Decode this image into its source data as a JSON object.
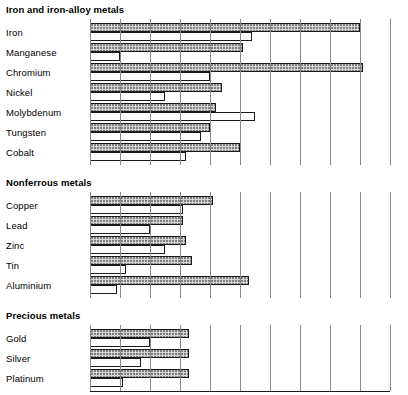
{
  "chart_data": {
    "type": "bar",
    "orientation": "horizontal",
    "title": "",
    "xlabel": "",
    "ylabel": "",
    "xlim": [
      1960,
      2600
    ],
    "xticks": [
      1960,
      1970,
      1980,
      1990,
      2000,
      2100,
      2200,
      2300,
      2400,
      2500,
      2600
    ],
    "xtick_labels": [
      "1960",
      "1970",
      "1980",
      "1990",
      "2000",
      "2100",
      "2200",
      "2300",
      "2400",
      "2500",
      "2600"
    ],
    "axis_note": "non-linear axis: 1960-2000 decade spacing equals 2000-2600 century spacing",
    "grid": true,
    "legend": null,
    "series": [
      {
        "name": "upper-hatched-bar",
        "style": "hatched"
      },
      {
        "name": "lower-white-bar",
        "style": "white"
      }
    ],
    "groups": [
      {
        "title": "Iron and iron-alloy metals",
        "rows": [
          {
            "label": "Iron",
            "hatched": 2500,
            "plain": 2140
          },
          {
            "label": "Manganese",
            "hatched": 2110,
            "plain": 1970
          },
          {
            "label": "Chromium",
            "hatched": 2510,
            "plain": 2000
          },
          {
            "label": "Nickel",
            "hatched": 2040,
            "plain": 1985
          },
          {
            "label": "Molybdenum",
            "hatched": 2020,
            "plain": 2150
          },
          {
            "label": "Tungsten",
            "hatched": 2000,
            "plain": 1997
          },
          {
            "label": "Cobalt",
            "hatched": 2100,
            "plain": 1992
          }
        ]
      },
      {
        "title": "Nonferrous metals",
        "rows": [
          {
            "label": "Copper",
            "hatched": 2010,
            "plain": 1991
          },
          {
            "label": "Lead",
            "hatched": 1991,
            "plain": 1980
          },
          {
            "label": "Zinc",
            "hatched": 1992,
            "plain": 1985
          },
          {
            "label": "Tin",
            "hatched": 1994,
            "plain": 1972
          },
          {
            "label": "Aluminium",
            "hatched": 2130,
            "plain": 1969
          }
        ]
      },
      {
        "title": "Precious metals",
        "rows": [
          {
            "label": "Gold",
            "hatched": 1993,
            "plain": 1980
          },
          {
            "label": "Silver",
            "hatched": 1993,
            "plain": 1977
          },
          {
            "label": "Platinum",
            "hatched": 1993,
            "plain": 1971
          }
        ]
      }
    ]
  }
}
